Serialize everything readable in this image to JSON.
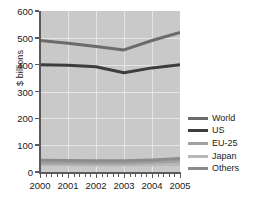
{
  "chart_data": {
    "type": "line",
    "title": "",
    "xlabel": "",
    "ylabel": "$ billions",
    "x": [
      2000,
      2001,
      2002,
      2003,
      2004,
      2005
    ],
    "categories": [
      "2000",
      "2001",
      "2002",
      "2003",
      "2004",
      "2005"
    ],
    "xlim": [
      2000,
      2005
    ],
    "ylim": [
      0,
      600
    ],
    "yticks": [
      0,
      100,
      200,
      300,
      400,
      500,
      600
    ],
    "ytick_labels": [
      "0",
      "100",
      "200",
      "300",
      "400",
      "500",
      "600"
    ],
    "grid": true,
    "legend_position": "right",
    "plot_background": "#c9c9c9",
    "series": [
      {
        "name": "World",
        "color": "#6b6b6b",
        "values": [
          490,
          480,
          468,
          455,
          490,
          520
        ]
      },
      {
        "name": "US",
        "color": "#3d3d3d",
        "values": [
          400,
          398,
          392,
          370,
          388,
          400
        ]
      },
      {
        "name": "EU-25",
        "color": "#a0a0a0",
        "values": [
          34,
          34,
          33,
          33,
          36,
          40
        ]
      },
      {
        "name": "Japan",
        "color": "#b8b8b8",
        "values": [
          28,
          27,
          26,
          26,
          27,
          28
        ]
      },
      {
        "name": "Others",
        "color": "#8c8c8c",
        "values": [
          44,
          43,
          42,
          42,
          45,
          50
        ]
      }
    ]
  },
  "legend": {
    "items": [
      {
        "label": "World",
        "color": "#6b6b6b"
      },
      {
        "label": "US",
        "color": "#3d3d3d"
      },
      {
        "label": "EU-25",
        "color": "#a0a0a0"
      },
      {
        "label": "Japan",
        "color": "#b8b8b8"
      },
      {
        "label": "Others",
        "color": "#8c8c8c"
      }
    ]
  }
}
